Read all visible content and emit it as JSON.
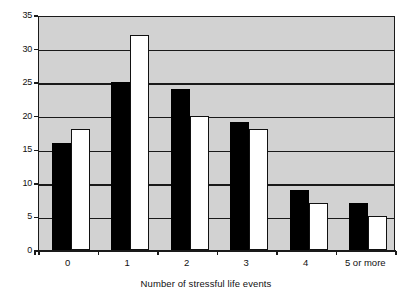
{
  "chart_data": {
    "type": "bar",
    "title": "",
    "xlabel": "Number of stressful life events",
    "ylabel": "",
    "categories": [
      "0",
      "1",
      "2",
      "3",
      "4",
      "5 or more"
    ],
    "series": [
      {
        "name": "series-a",
        "color": "#000000",
        "values": [
          16,
          25,
          24,
          19,
          9,
          7
        ]
      },
      {
        "name": "series-b",
        "color": "#ffffff",
        "values": [
          18,
          32,
          20,
          18,
          7,
          5
        ]
      }
    ],
    "ylim": [
      0,
      35
    ],
    "yticks": [
      0,
      5,
      10,
      15,
      20,
      25,
      30,
      35
    ],
    "ytick_labels": [
      "0",
      "5",
      "10",
      "15",
      "20",
      "25",
      "30",
      "35"
    ],
    "grid": true,
    "grid_axis": "y",
    "legend": null,
    "plot_background": "#d2d2d2",
    "axis_color": "#1a1a1a"
  }
}
